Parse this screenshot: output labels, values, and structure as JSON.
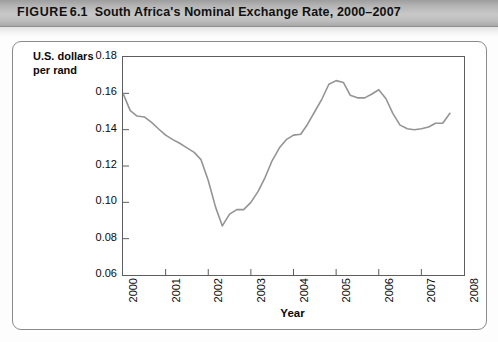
{
  "figure": {
    "label": "FIGURE",
    "number": "6.1",
    "caption": "South Africa's Nominal Exchange Rate, 2000–2007"
  },
  "chart_data": {
    "type": "line",
    "title": "South Africa's Nominal Exchange Rate, 2000–2007",
    "xlabel": "Year",
    "ylabel": "U.S. dollars per rand",
    "ylabel_line1": "U.S. dollars",
    "ylabel_line2": "per rand",
    "xlim": [
      2000,
      2008
    ],
    "ylim": [
      0.06,
      0.18
    ],
    "xticks": [
      2000,
      2001,
      2002,
      2003,
      2004,
      2005,
      2006,
      2007,
      2008
    ],
    "xtick_labels": [
      "2000",
      "2001",
      "2002",
      "2003",
      "2004",
      "2005",
      "2006",
      "2007",
      "2008"
    ],
    "yticks": [
      0.06,
      0.08,
      0.1,
      0.12,
      0.14,
      0.16,
      0.18
    ],
    "ytick_labels": [
      "0.06",
      "0.08",
      "0.10",
      "0.12",
      "0.14",
      "0.16",
      "0.18"
    ],
    "grid": false,
    "legend": "none",
    "line_color": "#949494",
    "line_width": 1.6,
    "series": [
      {
        "name": "U.S. dollars per rand",
        "x": [
          2000.0,
          2000.17,
          2000.33,
          2000.5,
          2000.67,
          2000.83,
          2001.0,
          2001.17,
          2001.33,
          2001.5,
          2001.67,
          2001.83,
          2002.0,
          2002.17,
          2002.33,
          2002.5,
          2002.67,
          2002.83,
          2003.0,
          2003.17,
          2003.33,
          2003.5,
          2003.67,
          2003.83,
          2004.0,
          2004.17,
          2004.33,
          2004.5,
          2004.67,
          2004.83,
          2005.0,
          2005.17,
          2005.33,
          2005.5,
          2005.67,
          2005.83,
          2006.0,
          2006.17,
          2006.33,
          2006.5,
          2006.67,
          2006.83,
          2007.0,
          2007.17,
          2007.33,
          2007.5,
          2007.67
        ],
        "y": [
          0.16,
          0.1505,
          0.1475,
          0.147,
          0.144,
          0.1405,
          0.137,
          0.1345,
          0.1325,
          0.13,
          0.1275,
          0.1235,
          0.112,
          0.0975,
          0.087,
          0.0935,
          0.096,
          0.096,
          0.1,
          0.106,
          0.1135,
          0.123,
          0.13,
          0.1345,
          0.137,
          0.1375,
          0.143,
          0.15,
          0.157,
          0.165,
          0.167,
          0.166,
          0.159,
          0.1575,
          0.1575,
          0.1595,
          0.162,
          0.157,
          0.149,
          0.1425,
          0.1405,
          0.14,
          0.1405,
          0.1415,
          0.1435,
          0.1435,
          0.149
        ]
      }
    ]
  }
}
